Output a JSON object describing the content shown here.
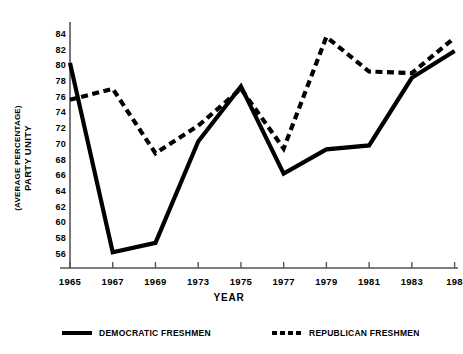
{
  "chart_data": {
    "type": "line",
    "title": "",
    "xlabel": "YEAR",
    "ylabel_line1": "PARTY UNITY",
    "ylabel_line2": "(AVERAGE PERCENTAGE)",
    "categories": [
      "1965",
      "1967",
      "1969",
      "1973",
      "1975",
      "1977",
      "1979",
      "1981",
      "1983",
      "198"
    ],
    "x_values": [
      1965,
      1967,
      1969,
      1973,
      1975,
      1977,
      1979,
      1981,
      1983,
      1985
    ],
    "y_ticks": [
      84,
      82,
      80,
      78,
      76,
      74,
      72,
      70,
      68,
      66,
      64,
      62,
      60,
      58,
      56
    ],
    "ylim": [
      54.2,
      85.5
    ],
    "grid": false,
    "legend_position": "bottom",
    "series": [
      {
        "name": "DEMOCRATIC FRESHMEN",
        "style": "solid",
        "color": "#000000",
        "values": [
          80.3,
          56.2,
          57.4,
          70.3,
          77.3,
          66.2,
          69.3,
          69.8,
          78.4,
          81.8
        ]
      },
      {
        "name": "REPUBLICAN FRESHMEN",
        "style": "dashed",
        "color": "#000000",
        "values": [
          75.6,
          77.0,
          68.8,
          72.3,
          77.0,
          69.4,
          83.6,
          79.2,
          79.0,
          83.5
        ]
      }
    ]
  },
  "legend": {
    "democratic": "DEMOCRATIC FRESHMEN",
    "republican": "REPUBLICAN FRESHMEN"
  },
  "axes": {
    "x_title": "YEAR",
    "y_title_line1": "PARTY UNITY",
    "y_title_line2": "(AVERAGE PERCENTAGE)"
  }
}
